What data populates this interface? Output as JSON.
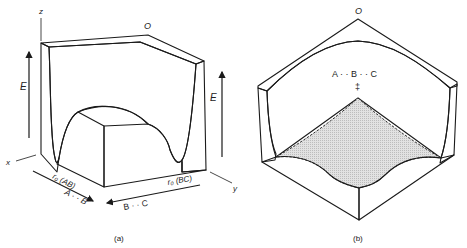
{
  "figure": {
    "panel_a": {
      "caption": "(a)",
      "origin_label": "O",
      "axis_x": "x",
      "axis_y": "y",
      "axis_z": "z",
      "energy_left": "E",
      "energy_right": "E",
      "r0_ab": "r₀ (AB)",
      "r0_bc": "r₀ (BC)",
      "reactant_arrow": "A · · B",
      "product_arrow": "B · · C"
    },
    "panel_b": {
      "caption": "(b)",
      "origin_label": "O",
      "transition_state": "A · · B · · C",
      "ts_symbol": "‡"
    },
    "colors": {
      "line": "#1a1a1a",
      "hatch": "#333333",
      "shade": "#d9d9d9",
      "background": "#ffffff"
    }
  }
}
